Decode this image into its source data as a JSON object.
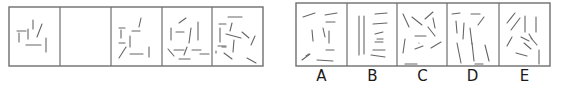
{
  "puzzle": {
    "type": "sequence-completion",
    "sequence": {
      "cells": [
        {
          "index": 1,
          "empty": false,
          "line_count": 7
        },
        {
          "index": 2,
          "empty": true,
          "line_count": 0
        },
        {
          "index": 3,
          "empty": false,
          "line_count": 9
        },
        {
          "index": 4,
          "empty": false,
          "line_count": 11
        },
        {
          "index": 5,
          "empty": false,
          "line_count": 13
        }
      ]
    },
    "options": [
      {
        "label": "A",
        "line_count": 10
      },
      {
        "label": "B",
        "line_count": 9
      },
      {
        "label": "C",
        "line_count": 11
      },
      {
        "label": "D",
        "line_count": 10
      },
      {
        "label": "E",
        "line_count": 11
      }
    ]
  },
  "colors": {
    "frame": "#6e6e6e",
    "stroke": "#666666",
    "label": "#1a1a1a",
    "background": "#ffffff"
  }
}
